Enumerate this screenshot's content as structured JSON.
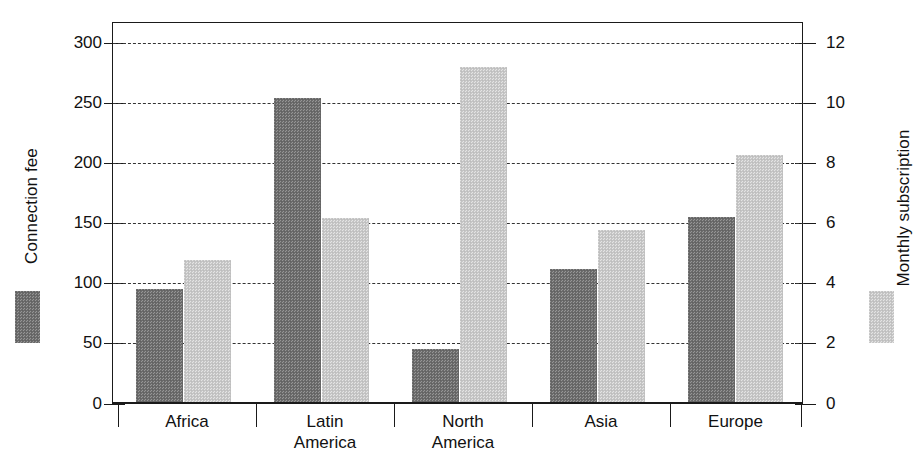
{
  "chart_data": {
    "type": "bar",
    "title": "",
    "subtitle": "",
    "xlabel": "",
    "categories": [
      "Africa",
      "Latin America",
      "North America",
      "Asia",
      "Europe"
    ],
    "category_lines": [
      [
        "Africa"
      ],
      [
        "Latin",
        "America"
      ],
      [
        "North",
        "America"
      ],
      [
        "Asia"
      ],
      [
        "Europe"
      ]
    ],
    "grid": true,
    "grid_style": "dashed horizontal",
    "legend_position": "axis-title-inline",
    "axes": {
      "left": {
        "label": "Connection fee",
        "ylim": [
          0,
          300
        ],
        "ticks": [
          0,
          50,
          100,
          150,
          200,
          250,
          300
        ],
        "tick_labels": [
          "0",
          "50",
          "100",
          "150",
          "200",
          "250",
          "300"
        ],
        "series": "Connection fee"
      },
      "right": {
        "label": "Monthly subscription",
        "ylim": [
          0,
          12
        ],
        "ticks": [
          0,
          2,
          4,
          6,
          8,
          10,
          12
        ],
        "tick_labels": [
          "0",
          "2",
          "4",
          "6",
          "8",
          "10",
          "12"
        ],
        "series": "Monthly subscription"
      }
    },
    "series": [
      {
        "name": "Connection fee",
        "axis": "left",
        "color": "#6e6e6e",
        "fill": "dark-dither",
        "values": [
          94,
          252,
          44,
          110,
          153
        ]
      },
      {
        "name": "Monthly subscription",
        "axis": "right",
        "color": "#c9c9c9",
        "fill": "light-dither",
        "values": [
          4.7,
          6.1,
          11.1,
          5.7,
          8.2
        ]
      }
    ]
  },
  "legend": {
    "left": {
      "label": "Connection fee",
      "swatch_color": "#6e6e6e",
      "swatch_name": "legend-swatch-connection-fee"
    },
    "right": {
      "label": "Monthly subscription",
      "swatch_color": "#c9c9c9",
      "swatch_name": "legend-swatch-monthly-subscription"
    }
  }
}
